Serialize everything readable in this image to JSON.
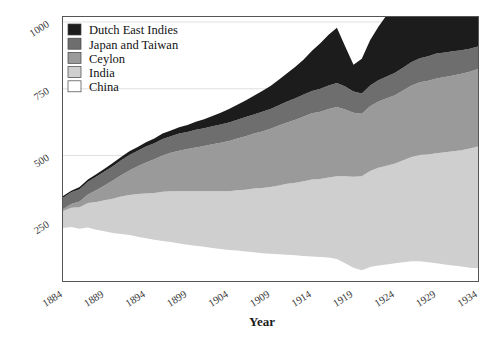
{
  "chart_data": {
    "type": "area",
    "stacked": true,
    "title": "",
    "xlabel": "Year",
    "ylabel": "",
    "xlim": [
      1884,
      1934
    ],
    "ylim": [
      0,
      1000
    ],
    "xticks": [
      "1884",
      "1889",
      "1894",
      "1899",
      "1904",
      "1909",
      "1914",
      "1919",
      "1924",
      "1929",
      "1934"
    ],
    "xtick_values": [
      1884,
      1889,
      1894,
      1899,
      1904,
      1909,
      1914,
      1919,
      1924,
      1929,
      1934
    ],
    "yticks": [
      "250",
      "500",
      "750",
      "1000"
    ],
    "ytick_values": [
      250,
      500,
      750,
      1000
    ],
    "grid": true,
    "legend_position": "top-left",
    "legend_order_top_to_bottom": [
      "Dutch East Indies",
      "Japan and Taiwan",
      "Ceylon",
      "India",
      "China"
    ],
    "stack_order_bottom_to_top": [
      "China",
      "India",
      "Ceylon",
      "Japan and Taiwan",
      "Dutch East Indies"
    ],
    "colors": {
      "Dutch East Indies": "#1c1c1c",
      "Japan and Taiwan": "#6e6e6e",
      "Ceylon": "#9a9a9a",
      "India": "#cfcfcf",
      "China": "#ffffff"
    },
    "x": [
      1884,
      1885,
      1886,
      1887,
      1888,
      1889,
      1890,
      1891,
      1892,
      1893,
      1894,
      1895,
      1896,
      1897,
      1898,
      1899,
      1900,
      1901,
      1902,
      1903,
      1904,
      1905,
      1906,
      1907,
      1908,
      1909,
      1910,
      1911,
      1912,
      1913,
      1914,
      1915,
      1916,
      1917,
      1918,
      1919,
      1920,
      1921,
      1922,
      1923,
      1924,
      1925,
      1926,
      1927,
      1928,
      1929,
      1930,
      1931,
      1932,
      1933,
      1934
    ],
    "series": [
      {
        "name": "China",
        "values": [
          228,
          232,
          226,
          230,
          222,
          216,
          210,
          206,
          202,
          196,
          190,
          184,
          180,
          176,
          170,
          166,
          162,
          158,
          154,
          150,
          146,
          144,
          140,
          138,
          134,
          132,
          130,
          128,
          126,
          124,
          122,
          120,
          118,
          112,
          96,
          80,
          70,
          82,
          88,
          92,
          96,
          100,
          104,
          104,
          100,
          96,
          92,
          88,
          84,
          80,
          78
        ]
      },
      {
        "name": "India",
        "values": [
          64,
          72,
          80,
          92,
          104,
          116,
          128,
          140,
          150,
          160,
          168,
          176,
          184,
          190,
          196,
          200,
          204,
          208,
          212,
          216,
          220,
          226,
          232,
          238,
          244,
          250,
          258,
          266,
          272,
          280,
          288,
          292,
          300,
          310,
          326,
          340,
          352,
          360,
          366,
          370,
          374,
          382,
          390,
          398,
          404,
          412,
          420,
          428,
          436,
          446,
          456
        ]
      },
      {
        "name": "Ceylon",
        "values": [
          8,
          14,
          22,
          32,
          44,
          56,
          68,
          80,
          92,
          104,
          116,
          126,
          136,
          144,
          152,
          158,
          164,
          170,
          176,
          182,
          188,
          194,
          200,
          206,
          212,
          218,
          224,
          230,
          236,
          242,
          248,
          252,
          256,
          260,
          250,
          240,
          234,
          242,
          248,
          252,
          256,
          262,
          268,
          272,
          276,
          280,
          282,
          284,
          286,
          288,
          290
        ]
      },
      {
        "name": "Japan and Taiwan",
        "values": [
          42,
          44,
          46,
          48,
          50,
          52,
          54,
          56,
          58,
          58,
          60,
          60,
          62,
          62,
          64,
          64,
          66,
          66,
          68,
          68,
          70,
          70,
          72,
          72,
          74,
          74,
          76,
          78,
          80,
          82,
          84,
          86,
          88,
          90,
          86,
          80,
          76,
          78,
          80,
          82,
          84,
          86,
          88,
          90,
          92,
          94,
          92,
          90,
          88,
          86,
          84
        ]
      },
      {
        "name": "Dutch East Indies",
        "values": [
          6,
          6,
          8,
          8,
          10,
          10,
          12,
          12,
          14,
          14,
          16,
          18,
          20,
          22,
          24,
          26,
          30,
          34,
          38,
          44,
          50,
          56,
          62,
          70,
          78,
          86,
          96,
          106,
          118,
          132,
          150,
          170,
          190,
          206,
          150,
          100,
          130,
          170,
          200,
          230,
          250,
          262,
          250,
          236,
          250,
          266,
          256,
          240,
          232,
          244,
          230
        ]
      }
    ]
  },
  "legend": {
    "items": [
      {
        "label": "Dutch East Indies",
        "color": "#1c1c1c"
      },
      {
        "label": "Japan and Taiwan",
        "color": "#6e6e6e"
      },
      {
        "label": "Ceylon",
        "color": "#9a9a9a"
      },
      {
        "label": "India",
        "color": "#cfcfcf"
      },
      {
        "label": "China",
        "color": "#ffffff"
      }
    ]
  },
  "axes": {
    "x_title": "Year",
    "y_title": ""
  }
}
